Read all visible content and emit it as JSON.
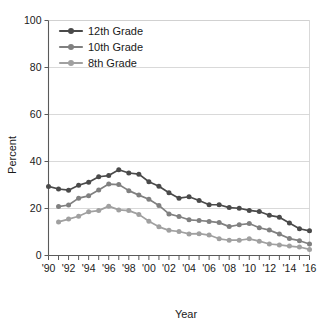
{
  "chart_data": {
    "type": "line",
    "title": "",
    "xlabel": "Year",
    "ylabel": "Percent",
    "xlim": [
      1990,
      2016
    ],
    "ylim": [
      0,
      100
    ],
    "grid": true,
    "legend_position": "top-left",
    "x": [
      1990,
      1991,
      1992,
      1993,
      1994,
      1995,
      1996,
      1997,
      1998,
      1999,
      2000,
      2001,
      2002,
      2003,
      2004,
      2005,
      2006,
      2007,
      2008,
      2009,
      2010,
      2011,
      2012,
      2013,
      2014,
      2015,
      2016
    ],
    "x_tick_labels": [
      "'90",
      "'92",
      "'94",
      "'96",
      "'98",
      "'00",
      "'02",
      "'04",
      "'06",
      "'08",
      "'10",
      "'12",
      "'14",
      "'16"
    ],
    "x_tick_values": [
      1990,
      1992,
      1994,
      1996,
      1998,
      2000,
      2002,
      2004,
      2006,
      2008,
      2010,
      2012,
      2014,
      2016
    ],
    "y_tick_labels": [
      "0",
      "20",
      "40",
      "60",
      "80",
      "100"
    ],
    "y_tick_values": [
      0,
      20,
      40,
      60,
      80,
      100
    ],
    "series": [
      {
        "name": "12th Grade",
        "color": "#4a4a4a",
        "values": [
          29.4,
          28.3,
          27.8,
          29.9,
          31.2,
          33.5,
          34.0,
          36.5,
          35.1,
          34.6,
          31.4,
          29.5,
          26.7,
          24.4,
          25.0,
          23.4,
          21.6,
          21.6,
          20.4,
          20.1,
          19.2,
          18.7,
          17.1,
          16.3,
          13.8,
          11.4,
          10.5
        ]
      },
      {
        "name": "10th Grade",
        "color": "#808080",
        "values": [
          null,
          20.8,
          21.5,
          24.4,
          25.4,
          27.9,
          30.4,
          30.2,
          27.6,
          25.7,
          23.9,
          21.3,
          17.7,
          16.6,
          15.2,
          14.9,
          14.5,
          14.0,
          12.3,
          13.1,
          13.6,
          11.8,
          10.8,
          9.1,
          7.2,
          6.3,
          4.9
        ]
      },
      {
        "name": "8th Grade",
        "color": "#a0a0a0",
        "values": [
          null,
          14.3,
          15.5,
          16.7,
          18.6,
          19.1,
          21.0,
          19.4,
          19.1,
          17.5,
          14.6,
          12.2,
          10.7,
          10.2,
          9.2,
          9.3,
          8.7,
          7.1,
          6.5,
          6.5,
          7.1,
          6.1,
          4.9,
          4.5,
          4.0,
          3.6,
          2.6
        ]
      }
    ]
  },
  "legend": {
    "items": [
      {
        "label": "12th Grade"
      },
      {
        "label": "10th Grade"
      },
      {
        "label": "8th Grade"
      }
    ]
  }
}
